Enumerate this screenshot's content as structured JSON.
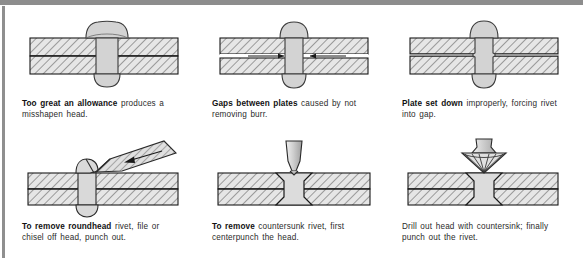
{
  "document": {
    "kind": "technical-illustration-page",
    "subject": "Rivet faults and rivet removal methods",
    "panel_count": 6
  },
  "colors": {
    "ink": "#2b2b2b",
    "ink_bold": "#111111",
    "line": "#1a1a1a",
    "metal_fill": "#d9d9d9",
    "plate_fill": "#e3e3e3",
    "hatch": "#555555",
    "frame": "#8d8d8d",
    "page": "#ffffff"
  },
  "panels": [
    {
      "id": "too-great-an-allowance",
      "figure_name": "rivet-too-much-allowance-diagram",
      "caption": {
        "bold": "Too great an allowance",
        "rest": " produces a misshapen head."
      }
    },
    {
      "id": "gaps-between-plates",
      "figure_name": "gap-between-plates-diagram",
      "caption": {
        "bold": "Gaps between plates",
        "rest": " caused by not removing burr."
      }
    },
    {
      "id": "plate-set-down",
      "figure_name": "plate-set-down-diagram",
      "caption": {
        "bold": "Plate set down",
        "rest": " improperly, forcing rivet into gap."
      }
    },
    {
      "id": "remove-roundhead",
      "figure_name": "chisel-off-roundhead-diagram",
      "caption": {
        "bold": "To remove roundhead",
        "rest": " rivet, file or chisel off head, punch out."
      }
    },
    {
      "id": "remove-countersunk",
      "figure_name": "centerpunch-countersunk-diagram",
      "caption": {
        "bold": "To remove",
        "rest": " countersunk rivet, first centerpunch the head."
      }
    },
    {
      "id": "drill-out-head",
      "figure_name": "countersink-drill-out-diagram",
      "caption": {
        "bold": "",
        "rest": "Drill out head with countersink; finally punch out the rivet."
      }
    }
  ]
}
